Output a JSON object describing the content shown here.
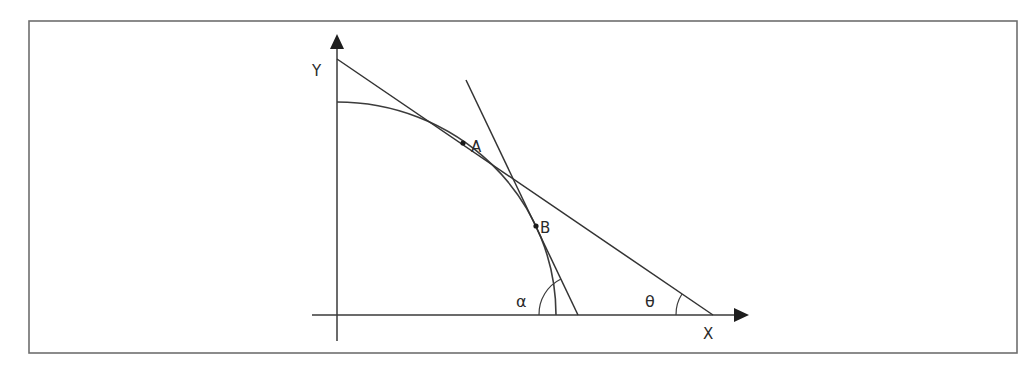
{
  "figure": {
    "type": "geometric diagram",
    "frame": {
      "x": 29,
      "y": 21,
      "width": 988,
      "height": 332
    }
  },
  "axes": {
    "origin": {
      "x": 337,
      "y": 315
    },
    "x_axis": {
      "label": "X",
      "from_x": 312,
      "to_x": 748
    },
    "y_axis": {
      "label": "Y",
      "from_y": 340,
      "to_y": 35
    }
  },
  "curve": {
    "description": "concave curve (quarter-ellipse) from Y-axis to X-axis",
    "y_intercept": {
      "x": 337,
      "y": 102
    },
    "x_intercept": {
      "x": 556,
      "y": 315
    }
  },
  "points": [
    {
      "name": "A",
      "label": "A",
      "x": 463,
      "y": 143
    },
    {
      "name": "B",
      "label": "B",
      "x": 536,
      "y": 226
    }
  ],
  "tangent_lines": [
    {
      "name": "tangent-at-A",
      "through": "A",
      "from": {
        "x": 337,
        "y": 59
      },
      "to": {
        "x": 713,
        "y": 315
      },
      "angle_label": "θ"
    },
    {
      "name": "tangent-at-B",
      "through": "B",
      "from": {
        "x": 466,
        "y": 80
      },
      "to": {
        "x": 578,
        "y": 315
      },
      "angle_label": "α"
    }
  ],
  "angles": {
    "alpha": {
      "symbol": "α",
      "label_x": 516,
      "label_y": 307
    },
    "theta": {
      "symbol": "θ",
      "label_x": 645,
      "label_y": 307
    }
  },
  "labels": {
    "y_axis": "Y",
    "x_axis": "X",
    "point_a": "A",
    "point_b": "B",
    "alpha": "α",
    "theta": "θ"
  }
}
